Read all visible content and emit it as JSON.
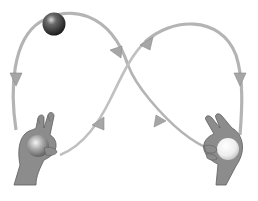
{
  "diagram": {
    "title": "",
    "colors": {
      "background": "#ffffff",
      "path": "#b4b4b4",
      "path_highlight": "#dcdcdc",
      "arrow": "#a8a8a8",
      "hand_fill": "#8c8c8c",
      "hand_shadow": "#5e5e5e",
      "dark_ball": "#2e2e2e",
      "light_ball": "#f2f2f2"
    },
    "elements": {
      "balls": [
        {
          "name": "dark-ball-top-left",
          "shade": "dark"
        },
        {
          "name": "gray-ball-left-hand",
          "shade": "medium"
        },
        {
          "name": "white-ball-right-hand",
          "shade": "light"
        }
      ],
      "hands": [
        {
          "name": "left-hand",
          "gesture": "two fingers raised holding ball"
        },
        {
          "name": "right-hand",
          "gesture": "two fingers raised holding ball"
        }
      ],
      "arrows": [
        {
          "name": "arrow-left-down"
        },
        {
          "name": "arrow-top-left-loop"
        },
        {
          "name": "arrow-top-right-loop"
        },
        {
          "name": "arrow-right-down"
        },
        {
          "name": "arrow-lower-left-up"
        },
        {
          "name": "arrow-lower-right-up"
        }
      ]
    }
  }
}
